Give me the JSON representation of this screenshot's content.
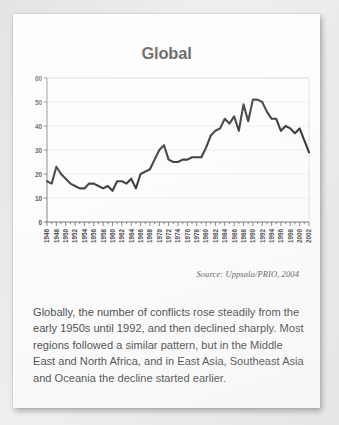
{
  "chart_title": "Global",
  "source_note": "Source: Uppsala/PRIO, 2004",
  "caption": "Globally, the number of conflicts rose steadily from the early 1950s until 1992, and then declined sharply. Most regions followed a similar pattern, but in the Middle East and North Africa, and in East Asia, Southeast Asia and Oceania the decline started earlier.",
  "chart_data": {
    "type": "line",
    "title": "Global",
    "xlabel": "",
    "ylabel": "",
    "xlim": [
      1946,
      2002
    ],
    "ylim": [
      0,
      60
    ],
    "yticks": [
      0,
      10,
      20,
      30,
      40,
      50,
      60
    ],
    "ytick_labels": [
      "0",
      "10",
      "20",
      "30",
      "40",
      "50",
      "60"
    ],
    "xtick_labels": [
      "1946",
      "1948",
      "1950",
      "1952",
      "1954",
      "1956",
      "1958",
      "1960",
      "1962",
      "1964",
      "1966",
      "1968",
      "1970",
      "1972",
      "1974",
      "1976",
      "1978",
      "1980",
      "1982",
      "1984",
      "1986",
      "1988",
      "1990",
      "1992",
      "1994",
      "1996",
      "1998",
      "2000",
      "2002"
    ],
    "xtick_label_interval": 2,
    "minor_tick_interval": 1,
    "grid": "horizontal",
    "legend": "none",
    "line_color": "#1a1a1a",
    "line_width": 2.1,
    "series": [
      {
        "name": "Number of conflicts",
        "x": [
          1946,
          1947,
          1948,
          1949,
          1950,
          1951,
          1952,
          1953,
          1954,
          1955,
          1956,
          1957,
          1958,
          1959,
          1960,
          1961,
          1962,
          1963,
          1964,
          1965,
          1966,
          1967,
          1968,
          1969,
          1970,
          1971,
          1972,
          1973,
          1974,
          1975,
          1976,
          1977,
          1978,
          1979,
          1980,
          1981,
          1982,
          1983,
          1984,
          1985,
          1986,
          1987,
          1988,
          1989,
          1990,
          1991,
          1992,
          1993,
          1994,
          1995,
          1996,
          1997,
          1998,
          1999,
          2000,
          2001,
          2002
        ],
        "values": [
          17,
          16,
          23,
          20,
          18,
          16,
          15,
          14,
          14,
          16,
          16,
          15,
          14,
          15,
          13,
          17,
          17,
          16,
          18,
          14,
          20,
          21,
          22,
          26,
          30,
          32,
          26,
          25,
          25,
          26,
          26,
          27,
          27,
          27,
          31,
          36,
          38,
          39,
          43,
          41,
          44,
          38,
          49,
          42,
          51,
          51,
          50,
          46,
          43,
          43,
          38,
          40,
          39,
          37,
          39,
          34,
          29
        ]
      }
    ]
  }
}
